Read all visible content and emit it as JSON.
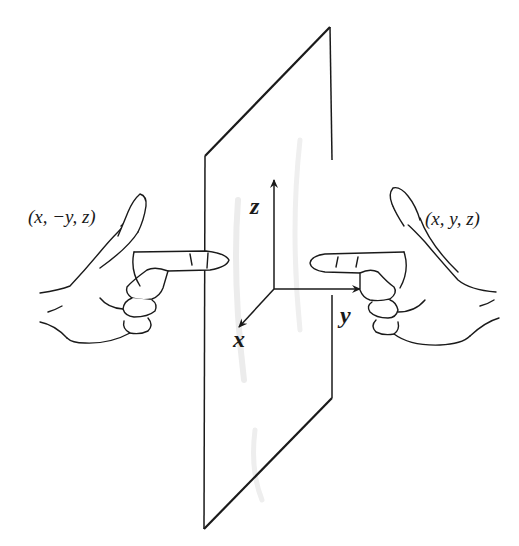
{
  "diagram": {
    "labels": {
      "left_point": "(x, −y, z)",
      "right_point": "(x, y, z)",
      "axis_x": "x",
      "axis_y": "y",
      "axis_z": "z"
    },
    "colors": {
      "stroke": "#1a1a1a",
      "mirror_shading": "#e6e6e6",
      "background": "#ffffff"
    },
    "mirror_corners": {
      "top_left": [
        205,
        156
      ],
      "top_right": [
        330,
        27
      ],
      "bottom_right": [
        332,
        398
      ],
      "bottom_left": [
        204,
        529
      ]
    },
    "axes_origin": [
      274,
      289
    ]
  }
}
